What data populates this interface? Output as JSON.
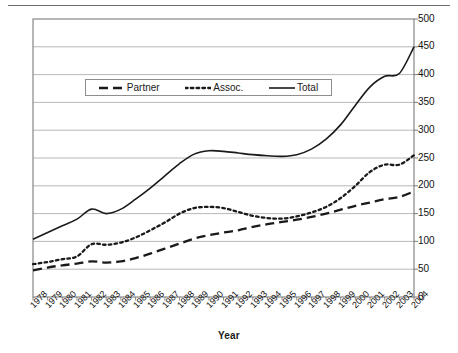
{
  "figure": {
    "axis_title_x": "Year",
    "legend": {
      "entries": [
        {
          "label": "Partner",
          "style": "dashed",
          "icon": "dashed-line-swatch"
        },
        {
          "label": "Assoc.",
          "style": "dotted",
          "icon": "dotted-line-swatch"
        },
        {
          "label": "Total",
          "style": "solid",
          "icon": "solid-line-swatch"
        }
      ]
    },
    "line_color": "#1a1a1a",
    "gridline_color": "#a6a6a6",
    "frame_color": "#6f6f6f"
  },
  "chart_data": {
    "type": "line",
    "title": "",
    "subtitle": "",
    "xlabel": "Year",
    "ylabel": "",
    "xlim": [
      1978,
      2004
    ],
    "ylim": [
      0,
      500
    ],
    "ytick_values": [
      0,
      50,
      100,
      150,
      200,
      250,
      300,
      350,
      400,
      450,
      500
    ],
    "ytick_labels": [
      "0",
      "50",
      "100",
      "150",
      "200",
      "250",
      "300",
      "350",
      "400",
      "450",
      "500"
    ],
    "yaxis_position": "right",
    "grid": true,
    "grid_axis": "y",
    "legend_position": "upper-left-inside",
    "categories": [
      1978,
      1979,
      1980,
      1981,
      1982,
      1983,
      1984,
      1985,
      1986,
      1987,
      1988,
      1989,
      1990,
      1991,
      1992,
      1993,
      1994,
      1995,
      1996,
      1997,
      1998,
      1999,
      2000,
      2001,
      2002,
      2003,
      2004
    ],
    "xtick_labels": [
      "1978",
      "1979",
      "1980",
      "1981",
      "1982",
      "1983",
      "1984",
      "1985",
      "1986",
      "1987",
      "1988",
      "1989",
      "1990",
      "1991",
      "1992",
      "1993",
      "1994",
      "1995",
      "1996",
      "1997",
      "1998",
      "1999",
      "2000",
      "2001",
      "2002",
      "2003",
      "2004"
    ],
    "series": [
      {
        "name": "Partner",
        "style": "dashed",
        "values": [
          48,
          53,
          57,
          60,
          64,
          62,
          64,
          70,
          78,
          87,
          96,
          105,
          111,
          116,
          120,
          126,
          131,
          135,
          139,
          144,
          150,
          157,
          164,
          170,
          176,
          180,
          190
        ]
      },
      {
        "name": "Assoc.",
        "style": "dotted",
        "values": [
          59,
          63,
          68,
          73,
          95,
          94,
          98,
          107,
          120,
          134,
          150,
          160,
          162,
          160,
          153,
          146,
          142,
          141,
          145,
          152,
          162,
          178,
          200,
          225,
          238,
          238,
          255
        ]
      },
      {
        "name": "Total",
        "style": "solid",
        "values": [
          104,
          116,
          128,
          140,
          158,
          150,
          158,
          176,
          196,
          218,
          240,
          257,
          263,
          262,
          259,
          256,
          254,
          253,
          256,
          266,
          284,
          310,
          345,
          378,
          397,
          402,
          450
        ]
      }
    ]
  }
}
